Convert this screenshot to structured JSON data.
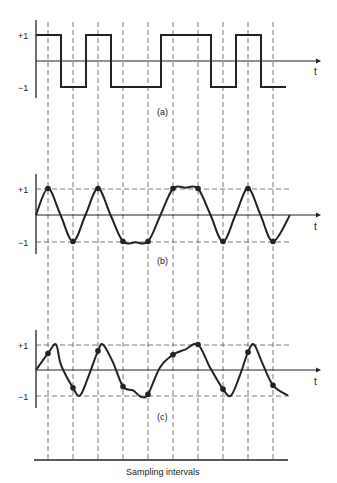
{
  "figure": {
    "bits": [
      1,
      0,
      1,
      0,
      0,
      1,
      1,
      0,
      1,
      0
    ],
    "axis_label_t": "t",
    "tick_plus": "+1",
    "tick_minus": "−1",
    "panels": [
      {
        "id": "a",
        "caption": "(a)",
        "kind": "square-wave"
      },
      {
        "id": "b",
        "caption": "(b)",
        "kind": "band-limited-ideal",
        "sample_values": [
          1,
          -1,
          1,
          -1,
          -1,
          1,
          1,
          -1,
          1,
          -1
        ]
      },
      {
        "id": "c",
        "caption": "(c)",
        "kind": "distorted",
        "sample_values": [
          0.65,
          -0.7,
          0.75,
          -0.65,
          -0.95,
          0.6,
          1.0,
          -0.75,
          0.7,
          -0.6
        ]
      }
    ],
    "sampling_label": "Sampling intervals",
    "ink_color": "#222222",
    "dash_color": "#555555"
  }
}
